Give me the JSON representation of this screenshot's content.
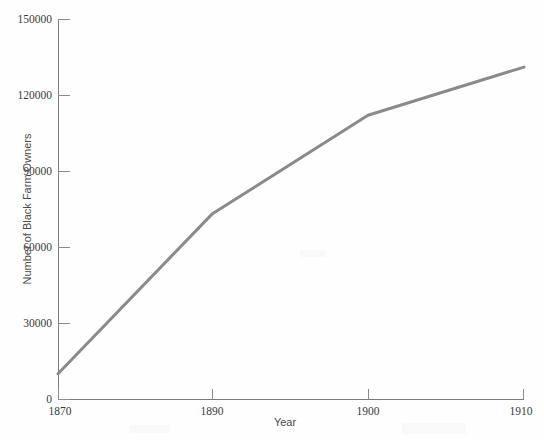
{
  "chart_data": {
    "type": "line",
    "title": "",
    "xlabel": "Year",
    "ylabel": "Number of Black Farm Owners",
    "x": [
      1870,
      1890,
      1900,
      1910
    ],
    "values": [
      10000,
      73000,
      112000,
      131000
    ],
    "categories": [
      "1870",
      "1890",
      "1900",
      "1910"
    ],
    "xtick_labels": [
      "1870",
      "1890",
      "1900",
      "1910"
    ],
    "ytick_labels": [
      "0",
      "30000",
      "60000",
      "90000",
      "120000",
      "150000"
    ],
    "ytick_values": [
      0,
      30000,
      60000,
      90000,
      120000,
      150000
    ],
    "ylim": [
      0,
      150000
    ],
    "xlim": [
      1870,
      1910
    ],
    "grid": false,
    "legend": false,
    "legend_position": "none",
    "series": [
      {
        "name": "Number of Black Farm Owners",
        "values": [
          10000,
          73000,
          112000,
          131000
        ]
      }
    ],
    "line_color": "#8a8a8a",
    "line_width": 3,
    "background_color": "#fefefe",
    "axis_color": "#7c7c7c",
    "text_color": "#3a3a3a"
  },
  "axes": {
    "x_title": "Year",
    "y_title": "Number of Black Farm Owners"
  },
  "ylabels": {
    "t0": "0",
    "t1": "30000",
    "t2": "60000",
    "t3": "90000",
    "t4": "120000",
    "t5": "150000"
  },
  "xlabels": {
    "t0": "1870",
    "t1": "1890",
    "t2": "1900",
    "t3": "1910"
  }
}
